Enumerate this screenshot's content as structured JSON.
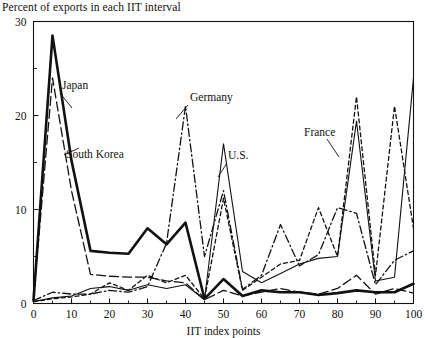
{
  "figure": {
    "title": "Percent of exports in each IIT interval"
  },
  "chart_data": {
    "type": "line",
    "title": "Percent of exports in each IIT interval",
    "xlabel": "IIT index points",
    "ylabel": "",
    "xlim": [
      0,
      100
    ],
    "ylim": [
      0,
      30
    ],
    "xticks": [
      0,
      10,
      20,
      30,
      40,
      50,
      60,
      70,
      80,
      90,
      100
    ],
    "xtick_labels": [
      "0",
      "10",
      "20",
      "30",
      "40",
      "50",
      "60",
      "70",
      "80",
      "90",
      "100"
    ],
    "x_minor_ticks": [
      5,
      15,
      25,
      35,
      45,
      55,
      65,
      75,
      85,
      95
    ],
    "yticks": [
      0,
      10,
      20,
      30
    ],
    "ytick_labels": [
      "0",
      "10",
      "20",
      "30"
    ],
    "y_minor_ticks": [
      5,
      15,
      25
    ],
    "grid": false,
    "legend_position": "inline-annotations",
    "x": [
      0,
      5,
      10,
      15,
      20,
      25,
      30,
      35,
      40,
      45,
      50,
      55,
      60,
      65,
      70,
      75,
      80,
      85,
      90,
      95,
      100
    ],
    "series": [
      {
        "name": "Japan",
        "style": "solid-thick",
        "label_x": 21,
        "label_y": 24.2,
        "values": [
          0.3,
          28.5,
          15.2,
          5.6,
          5.4,
          5.3,
          8.0,
          6.3,
          8.6,
          0.5,
          2.6,
          0.8,
          1.4,
          1.2,
          1.2,
          0.9,
          1.1,
          1.4,
          1.2,
          1.2,
          2.1
        ]
      },
      {
        "name": "South Korea",
        "style": "long-dash",
        "label_x": 28,
        "label_y": 16.8,
        "values": [
          0.4,
          24.0,
          12.0,
          3.1,
          2.9,
          2.8,
          2.8,
          2.4,
          2.2,
          0.4,
          1.4,
          0.8,
          1.2,
          1.6,
          1.2,
          1.0,
          1.6,
          3.0,
          1.0,
          1.6,
          1.1
        ]
      },
      {
        "name": "Germany",
        "style": "dash-dot",
        "label_x": 48,
        "label_y": 21.6,
        "values": [
          0.3,
          1.2,
          1.0,
          1.0,
          1.4,
          1.2,
          1.8,
          6.4,
          21.0,
          5.0,
          12.0,
          1.5,
          3.0,
          8.4,
          4.0,
          5.2,
          10.2,
          9.6,
          2.0,
          4.6,
          5.6
        ]
      },
      {
        "name": "U.S.",
        "style": "thin-solid",
        "label_x": 57,
        "label_y": 15.2,
        "values": [
          0.2,
          0.6,
          0.8,
          1.6,
          1.8,
          1.4,
          2.0,
          1.6,
          2.0,
          0.4,
          17.0,
          3.4,
          2.2,
          3.2,
          4.2,
          4.8,
          5.0,
          19.4,
          2.4,
          2.8,
          24.0
        ]
      },
      {
        "name": "France",
        "style": "short-dash",
        "label_x": 73,
        "label_y": 17.6,
        "values": [
          0.2,
          0.5,
          0.7,
          1.0,
          2.2,
          1.4,
          3.0,
          2.2,
          3.0,
          0.5,
          11.2,
          1.4,
          2.8,
          4.2,
          4.6,
          10.2,
          5.0,
          22.0,
          3.0,
          21.0,
          8.0
        ]
      }
    ]
  }
}
